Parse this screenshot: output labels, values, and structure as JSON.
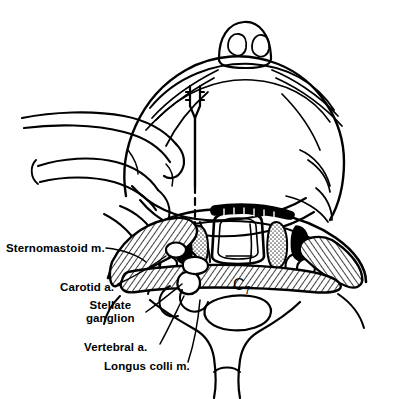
{
  "figure": {
    "view": "superior (bird's-eye) view",
    "ink_color": "#000000",
    "background_color": "#ffffff"
  },
  "labels": {
    "sternomastoid": "Sternomastoid m.",
    "carotid": "Carotid a.",
    "stellate_line1": "Stellate",
    "stellate_line2": "ganglion",
    "vertebral": "Vertebral a.",
    "longus_colli": "Longus colli m.",
    "vertebral_level": "C",
    "vertebral_level_sub": "7"
  },
  "structures": [
    {
      "name": "nose",
      "note": "nostrils visible at top, viewed from above"
    },
    {
      "name": "face-forehead",
      "note": "large oval cranium outline"
    },
    {
      "name": "practitioner-hand",
      "note": "fingers retracting carotid sheath laterally, left side"
    },
    {
      "name": "needle",
      "note": "vertical needle with hub, dashed where hidden, tip at C7 transverse process"
    },
    {
      "name": "sternomastoid-muscle",
      "note": "hatched band, left and right"
    },
    {
      "name": "carotid-artery",
      "note": "small oval vessel beneath retracting fingers"
    },
    {
      "name": "stellate-ganglion",
      "note": "small nodular structure at needle tip"
    },
    {
      "name": "vertebral-artery",
      "note": "small circle lateral to vertebral body"
    },
    {
      "name": "longus-colli-muscle",
      "note": "hatched transverse band anterior to vertebral body"
    },
    {
      "name": "vertebral-body-c7",
      "note": "central body of seventh cervical vertebra"
    },
    {
      "name": "spinal-canal",
      "note": "rounded canal with cord outline"
    },
    {
      "name": "paraspinal-muscles",
      "note": "stippled muscle bellies flanking spinous process"
    },
    {
      "name": "trachea",
      "note": "midline airway below cross-section"
    },
    {
      "name": "thyroid-gland",
      "note": "lobes flanking the trachea"
    }
  ]
}
